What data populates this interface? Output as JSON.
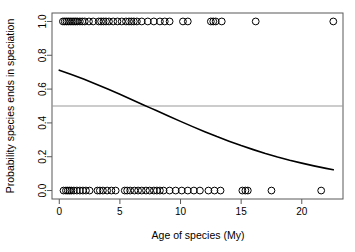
{
  "chart_data": {
    "type": "scatter",
    "title": "",
    "subtitle": "",
    "xlabel": "Age of species (My)",
    "ylabel": "Probability species ends in speciation",
    "xlim": [
      -0.6,
      23.4
    ],
    "ylim": [
      -0.05,
      1.05
    ],
    "xticks": [
      0,
      5,
      10,
      15,
      20
    ],
    "xticklabels": [
      "0",
      "5",
      "10",
      "15",
      "20"
    ],
    "yticks": [
      0.0,
      0.2,
      0.4,
      0.6,
      0.8,
      1.0
    ],
    "yticklabels": [
      "0.0",
      "0.2",
      "0.4",
      "0.6",
      "0.8",
      "1.0"
    ],
    "grid": false,
    "legend": null,
    "point_style": {
      "marker": "open-circle",
      "stroke": "#000000",
      "fill": "none",
      "radius": 3.4
    },
    "series": [
      {
        "name": "speciation outcome (1 = speciation)",
        "type": "scatter",
        "y_value": 1.0,
        "x": [
          0.3,
          0.45,
          0.6,
          0.75,
          0.9,
          1.05,
          1.2,
          1.35,
          1.5,
          1.7,
          1.9,
          2.1,
          2.45,
          2.8,
          3.25,
          3.45,
          3.65,
          3.85,
          4.1,
          4.45,
          4.8,
          5.15,
          5.5,
          5.75,
          5.95,
          6.15,
          6.4,
          6.8,
          7.3,
          7.8,
          8.3,
          8.7,
          9.1,
          10.2,
          10.6,
          12.5,
          12.7,
          12.9,
          13.4,
          16.2,
          22.6
        ]
      },
      {
        "name": "speciation outcome (0 = extinction)",
        "type": "scatter",
        "y_value": 0.0,
        "x": [
          0.35,
          0.55,
          0.7,
          0.85,
          1.0,
          1.2,
          1.45,
          1.7,
          1.95,
          2.2,
          2.5,
          3.15,
          3.35,
          3.6,
          3.95,
          4.3,
          4.65,
          5.4,
          5.6,
          5.85,
          6.2,
          6.5,
          6.8,
          7.15,
          7.45,
          7.8,
          8.05,
          8.3,
          8.6,
          9.1,
          9.6,
          10.1,
          10.6,
          11.1,
          11.6,
          12.3,
          12.8,
          13.3,
          15.1,
          15.35,
          15.55,
          17.5,
          21.6
        ]
      },
      {
        "name": "fitted logistic curve",
        "type": "line",
        "stroke": "#000000",
        "width": 1.6,
        "x": [
          0.0,
          1.0,
          2.0,
          3.0,
          4.0,
          5.0,
          6.0,
          7.0,
          7.5,
          8.0,
          9.0,
          10.0,
          11.0,
          12.0,
          13.0,
          14.0,
          15.0,
          16.0,
          17.0,
          18.0,
          19.0,
          20.0,
          21.0,
          22.0,
          22.6
        ],
        "y": [
          0.712,
          0.686,
          0.659,
          0.63,
          0.6,
          0.569,
          0.537,
          0.505,
          0.489,
          0.473,
          0.441,
          0.409,
          0.378,
          0.348,
          0.319,
          0.292,
          0.266,
          0.242,
          0.219,
          0.198,
          0.179,
          0.162,
          0.146,
          0.131,
          0.123
        ]
      },
      {
        "name": "reference line at p = 0.5",
        "type": "hline",
        "y_value": 0.5,
        "stroke": "#999999",
        "width": 1.0
      }
    ]
  },
  "axes": {
    "x_title": "Age of species (My)",
    "y_title": "Probability species ends in speciation"
  }
}
